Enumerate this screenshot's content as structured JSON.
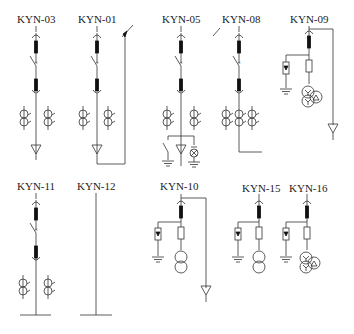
{
  "diagram": {
    "type": "switchgear single-line schematics",
    "cabinets": [
      {
        "id": "KYN-03",
        "label": "KYN-03",
        "components": [
          "bus contact",
          "circuit breaker",
          "outgoing contact",
          "current transformer x2",
          "cable terminal"
        ]
      },
      {
        "id": "KYN-01",
        "label": "KYN-01",
        "components": [
          "bus contact",
          "circuit breaker",
          "outgoing contact",
          "current transformer x2",
          "cable terminal",
          "side bus connection"
        ]
      },
      {
        "id": "KYN-05",
        "label": "KYN-05",
        "components": [
          "bus contact",
          "circuit breaker",
          "outgoing contact",
          "current transformer x2",
          "earthing switch",
          "cable terminal",
          "indicator lamp"
        ]
      },
      {
        "id": "KYN-08",
        "label": "KYN-08",
        "components": [
          "bus contact",
          "circuit breaker",
          "outgoing contact",
          "current transformer x3",
          "side connection"
        ]
      },
      {
        "id": "KYN-09",
        "label": "KYN-09",
        "components": [
          "bus contact",
          "arrester",
          "fuse",
          "voltage transformer Y-Y-delta",
          "cable terminal"
        ]
      },
      {
        "id": "KYN-11",
        "label": "KYN-11",
        "components": [
          "bus contact",
          "circuit breaker",
          "outgoing contact",
          "current transformer x2",
          "busbar"
        ]
      },
      {
        "id": "KYN-12",
        "label": "KYN-12",
        "components": [
          "busbar riser"
        ]
      },
      {
        "id": "KYN-10",
        "label": "KYN-10",
        "components": [
          "bus contact",
          "arrester",
          "fuse",
          "voltage transformer",
          "cable terminal"
        ]
      },
      {
        "id": "KYN-15",
        "label": "KYN-15",
        "components": [
          "bus contact",
          "arrester",
          "fuse",
          "voltage transformer"
        ]
      },
      {
        "id": "KYN-16",
        "label": "KYN-16",
        "components": [
          "bus contact",
          "arrester",
          "fuse",
          "voltage transformer Y-Y-delta"
        ]
      }
    ]
  },
  "labels": {
    "kyn03": "KYN-03",
    "kyn01": "KYN-01",
    "kyn05": "KYN-05",
    "kyn08": "KYN-08",
    "kyn09": "KYN-09",
    "kyn11": "KYN-11",
    "kyn12": "KYN-12",
    "kyn10": "KYN-10",
    "kyn15": "KYN-15",
    "kyn16": "KYN-16"
  }
}
